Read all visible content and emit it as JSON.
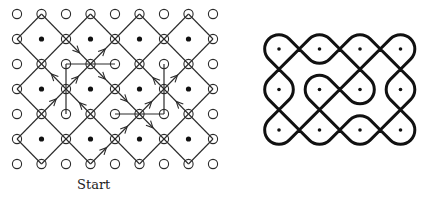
{
  "figure": {
    "left_panel": {
      "label": "Start",
      "grid": {
        "cols": 9,
        "rows": 7,
        "x0": 17,
        "y0": 14,
        "dx": 24.5,
        "dy": 25
      },
      "dot_radius": 2.6,
      "circle_radius": 4.6,
      "straight_lines": [
        {
          "from": [
            2,
            2
          ],
          "to": [
            4,
            2
          ]
        },
        {
          "from": [
            2,
            2
          ],
          "to": [
            2,
            4
          ]
        },
        {
          "from": [
            4,
            4
          ],
          "to": [
            6,
            4
          ]
        },
        {
          "from": [
            6,
            2
          ],
          "to": [
            6,
            4
          ]
        }
      ],
      "arrows": [
        {
          "from": [
            2,
            1
          ],
          "to": [
            3,
            2
          ],
          "t": 0.55
        },
        {
          "from": [
            3,
            2
          ],
          "to": [
            4,
            1
          ],
          "t": 0.6
        },
        {
          "from": [
            2,
            3
          ],
          "to": [
            3,
            2
          ],
          "t": 0.5
        },
        {
          "from": [
            3,
            2
          ],
          "to": [
            4,
            3
          ],
          "t": 0.6
        },
        {
          "from": [
            2,
            3
          ],
          "to": [
            1,
            2
          ],
          "t": 0.6
        },
        {
          "from": [
            1,
            4
          ],
          "to": [
            2,
            3
          ],
          "t": 0.6
        },
        {
          "from": [
            3,
            4
          ],
          "to": [
            2,
            3
          ],
          "t": 0.45
        },
        {
          "from": [
            6,
            3
          ],
          "to": [
            5,
            2
          ],
          "t": 0.45
        },
        {
          "from": [
            6,
            3
          ],
          "to": [
            7,
            2
          ],
          "t": 0.55
        },
        {
          "from": [
            7,
            4
          ],
          "to": [
            6,
            3
          ],
          "t": 0.5
        },
        {
          "from": [
            5,
            4
          ],
          "to": [
            6,
            3
          ],
          "t": 0.5
        },
        {
          "from": [
            4,
            3
          ],
          "to": [
            5,
            4
          ],
          "t": 0.5
        },
        {
          "from": [
            5,
            4
          ],
          "to": [
            6,
            5
          ],
          "t": 0.55
        },
        {
          "from": [
            4,
            5
          ],
          "to": [
            5,
            4
          ],
          "t": 0.5
        },
        {
          "from": [
            3,
            6
          ],
          "to": [
            4,
            5
          ],
          "t": 0.65
        }
      ],
      "colors": {
        "stroke": "#2a2a2a",
        "dot": "#111111"
      }
    },
    "right_panel": {
      "grid": {
        "cols": 4,
        "rows": 3,
        "x0": 279,
        "y0": 49,
        "spacing": 40.5
      },
      "dot_radius": 1.8,
      "stroke_width": 3,
      "cells": [
        {
          "c": 0,
          "r": 0,
          "top": "R",
          "right": "X",
          "bottom": "X",
          "left": "R"
        },
        {
          "c": 1,
          "r": 0,
          "top": "R",
          "right": "X",
          "bottom": "R",
          "left": "X"
        },
        {
          "c": 2,
          "r": 0,
          "top": "R",
          "right": "X",
          "bottom": "X",
          "left": "X"
        },
        {
          "c": 3,
          "r": 0,
          "top": "R",
          "right": "R",
          "bottom": "X",
          "left": "X"
        },
        {
          "c": 0,
          "r": 1,
          "top": "X",
          "right": "R",
          "bottom": "X",
          "left": "R"
        },
        {
          "c": 1,
          "r": 1,
          "top": "R",
          "right": "X",
          "bottom": "X",
          "left": "R"
        },
        {
          "c": 2,
          "r": 1,
          "top": "X",
          "right": "R",
          "bottom": "R",
          "left": "X"
        },
        {
          "c": 3,
          "r": 1,
          "top": "X",
          "right": "R",
          "bottom": "X",
          "left": "R"
        },
        {
          "c": 0,
          "r": 2,
          "top": "X",
          "right": "X",
          "bottom": "R",
          "left": "R"
        },
        {
          "c": 1,
          "r": 2,
          "top": "X",
          "right": "X",
          "bottom": "R",
          "left": "X"
        },
        {
          "c": 2,
          "r": 2,
          "top": "R",
          "right": "X",
          "bottom": "R",
          "left": "X"
        },
        {
          "c": 3,
          "r": 2,
          "top": "X",
          "right": "R",
          "bottom": "R",
          "left": "X"
        }
      ],
      "colors": {
        "stroke": "#111111",
        "dot": "#111111"
      }
    }
  }
}
